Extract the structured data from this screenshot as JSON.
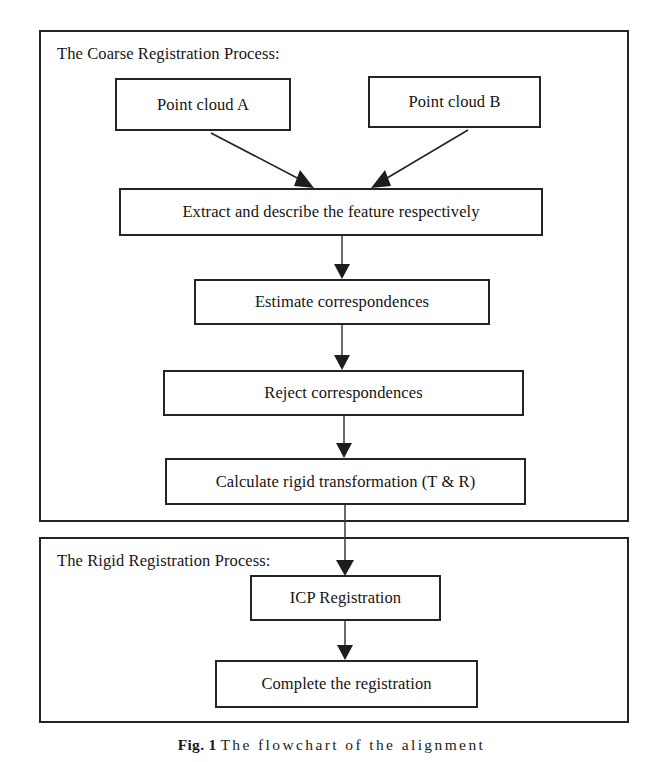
{
  "figure": {
    "caption_label": "Fig. 1",
    "caption_text": "The flowchart of the alignment"
  },
  "panels": [
    {
      "id": "coarse",
      "title": "The Coarse Registration Process:"
    },
    {
      "id": "rigid",
      "title": "The Rigid Registration Process:"
    }
  ],
  "nodes": {
    "cloud_a": "Point cloud A",
    "cloud_b": "Point cloud B",
    "extract": "Extract and describe the feature respectively",
    "estimate": "Estimate correspondences",
    "reject": "Reject correspondences",
    "calculate": "Calculate rigid transformation (T & R)",
    "icp": "ICP Registration",
    "complete": "Complete the registration"
  },
  "edges": [
    {
      "from": "cloud_a",
      "to": "extract",
      "style": "diagonal-arrow"
    },
    {
      "from": "cloud_b",
      "to": "extract",
      "style": "diagonal-arrow"
    },
    {
      "from": "extract",
      "to": "estimate",
      "style": "vertical-arrow"
    },
    {
      "from": "estimate",
      "to": "reject",
      "style": "vertical-arrow"
    },
    {
      "from": "reject",
      "to": "calculate",
      "style": "vertical-arrow"
    },
    {
      "from": "calculate",
      "to": "icp",
      "style": "vertical-arrow-crosses-panels"
    },
    {
      "from": "icp",
      "to": "complete",
      "style": "vertical-arrow"
    }
  ],
  "colors": {
    "stroke": "#232323",
    "text": "#141414",
    "background": "#ffffff"
  }
}
